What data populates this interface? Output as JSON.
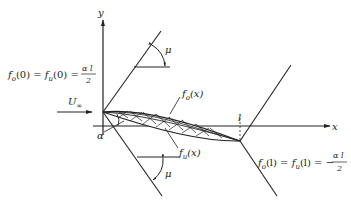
{
  "axes": {
    "x_label": "x",
    "y_label": "y"
  },
  "labels": {
    "mu_top": "μ",
    "mu_bottom": "μ",
    "alpha": "α",
    "freestream": "U",
    "freestream_sub": "∞",
    "chord_length": "l",
    "upper_surface": "f",
    "upper_surface_sub": "o",
    "upper_surface_arg": "(x)",
    "lower_surface": "f",
    "lower_surface_sub": "u",
    "lower_surface_arg": "(x)"
  },
  "equations": {
    "leading_edge": {
      "lhs1": "f",
      "lhs1_sub": "o",
      "lhs1_arg": "(0) = ",
      "lhs2": "f",
      "lhs2_sub": "u",
      "lhs2_arg": "(0) = ",
      "numerator": "α l",
      "denominator": "2"
    },
    "trailing_edge": {
      "lhs1": "f",
      "lhs1_sub": "o",
      "lhs1_arg": "(l) = ",
      "lhs2": "f",
      "lhs2_sub": "u",
      "lhs2_arg": "(l) = −",
      "numerator": "α l",
      "denominator": "2"
    }
  }
}
